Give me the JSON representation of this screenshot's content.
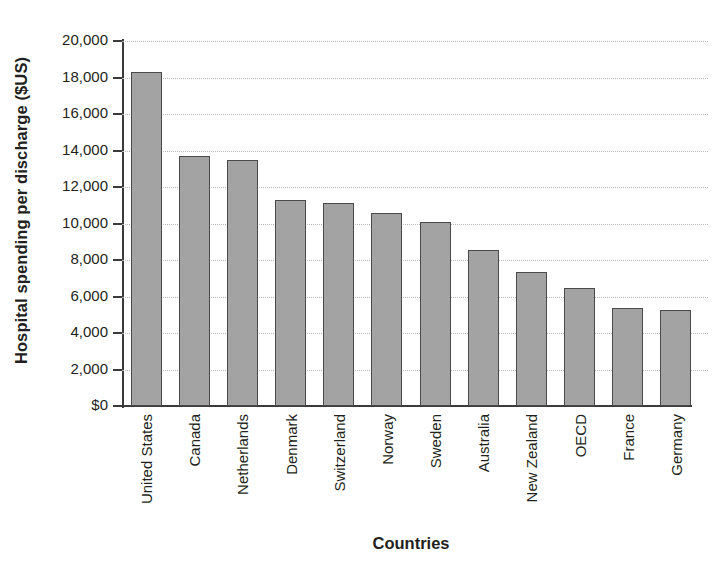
{
  "chart_data": {
    "type": "bar",
    "title": "",
    "xlabel": "Countries",
    "ylabel": "Hospital spending per discharge ($US)",
    "categories": [
      "United States",
      "Canada",
      "Netherlands",
      "Denmark",
      "Switzerland",
      "Norway",
      "Sweden",
      "Australia",
      "New Zealand",
      "OECD",
      "France",
      "Germany"
    ],
    "values": [
      18300,
      13700,
      13500,
      11300,
      11100,
      10600,
      10100,
      8550,
      7350,
      6450,
      5350,
      5250
    ],
    "ylim": [
      0,
      20000
    ],
    "ytick_values": [
      20000,
      18000,
      16000,
      14000,
      12000,
      10000,
      8000,
      6000,
      4000,
      2000,
      0
    ],
    "ytick_labels": [
      "20,000",
      "18,000",
      "16,000",
      "14,000",
      "12,000",
      "10,000",
      "8,000",
      "6,000",
      "4,000",
      "2,000",
      "$0"
    ],
    "grid": true,
    "grid_style": "dotted",
    "legend": "none",
    "bar_color": "#a3a3a3",
    "bar_edge_color": "#4a4a4a",
    "axis_color": "#3a3a3a",
    "grid_color": "#b9b9b9",
    "background": "#ffffff"
  }
}
